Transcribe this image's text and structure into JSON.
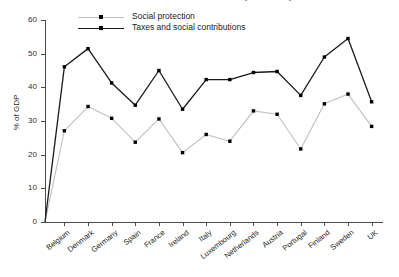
{
  "chart_data": {
    "type": "line",
    "title": "Taxes and social contributions (% of GDP)",
    "xlabel": "",
    "ylabel": "% of GDP",
    "ylim": [
      0,
      60
    ],
    "yticks": [
      0,
      10,
      20,
      30,
      40,
      50,
      60
    ],
    "grid": false,
    "legend_position": "top-left",
    "categories": [
      "Belgium",
      "Denmark",
      "Germany",
      "Spain",
      "France",
      "Ireland",
      "Italy",
      "Luxembourg",
      "Netherlands",
      "Austria",
      "Portugal",
      "Finland",
      "Sweden",
      "UK"
    ],
    "series": [
      {
        "name": "Social protection",
        "color": "#bfbfbf",
        "marker_color": "#000000",
        "values": [
          27.1,
          34.3,
          30.8,
          23.7,
          30.6,
          20.6,
          26.0,
          24.0,
          33.0,
          32.0,
          21.7,
          35.1,
          38.0,
          28.4
        ]
      },
      {
        "name": "Taxes and social contributions",
        "color": "#1a1a1a",
        "marker_color": "#000000",
        "values": [
          46.1,
          51.5,
          41.3,
          34.7,
          45.0,
          33.5,
          42.3,
          42.3,
          44.4,
          44.7,
          37.6,
          49.0,
          54.5,
          35.7
        ]
      }
    ]
  }
}
